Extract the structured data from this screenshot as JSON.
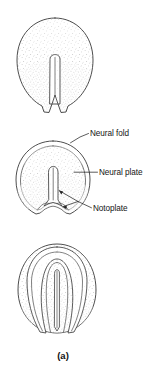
{
  "figure": {
    "caption": "(a)",
    "panel_count": 3,
    "background_color": "#ffffff",
    "ink_color": "#333333",
    "stipple_color": "#9a9a9a"
  },
  "labels": [
    {
      "id": "neural-fold",
      "text": "Neural fold",
      "text_x": 90,
      "text_y": 136,
      "leader": "M 88.5 133.5 L 80 137 L 70 142.5"
    },
    {
      "id": "neural-plate",
      "text": "Neural plate",
      "text_x": 99,
      "text_y": 175,
      "leader": "M 97.5 172.2 L 86 172.2 L 74 172.2"
    },
    {
      "id": "notoplate",
      "text": "Notoplate",
      "text_x": 93,
      "text_y": 211,
      "leader_main": "M 91.5 207.8 L 78 201",
      "leader_fork_left": "M 78 201 L 58.5 190",
      "leader_fork_right": "M 78 201 L 62.5 206.5"
    }
  ],
  "panels": [
    {
      "id": "panel-top",
      "stage": "neural plate stage",
      "center_x": 55,
      "center_y": 66,
      "features": [
        "embryo-outline",
        "midline-groove"
      ]
    },
    {
      "id": "panel-middle",
      "stage": "neural fold elevation stage",
      "center_x": 53,
      "center_y": 178,
      "features": [
        "embryo-outline",
        "neural-fold-rim",
        "neural-plate",
        "notoplate",
        "midline-groove"
      ]
    },
    {
      "id": "panel-bottom",
      "stage": "neural fold convergence stage",
      "center_x": 57,
      "center_y": 290,
      "features": [
        "embryo-outline",
        "neural-fold-rim",
        "converging-folds",
        "neural-groove"
      ]
    }
  ]
}
